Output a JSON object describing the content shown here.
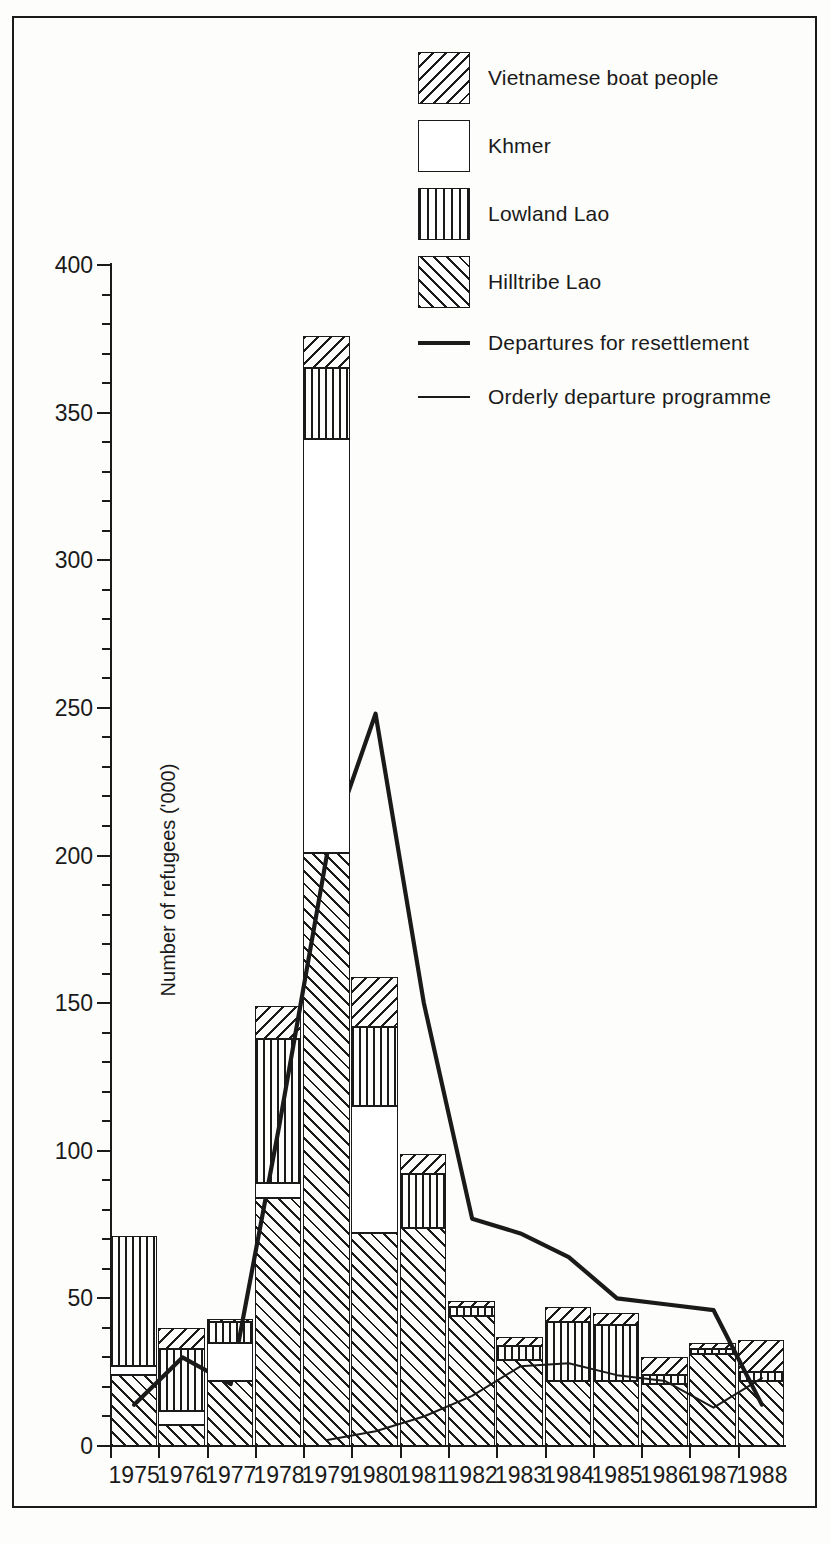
{
  "chart_data": {
    "type": "bar",
    "subtype": "stacked-bar-with-lines",
    "title": "",
    "xlabel": "",
    "ylabel": "Number of refugees ('000)",
    "ylim": [
      0,
      400
    ],
    "ytick_major": [
      0,
      50,
      100,
      150,
      200,
      250,
      300,
      350,
      400
    ],
    "ytick_labels": [
      "0",
      "50",
      "100",
      "150",
      "200",
      "250",
      "300",
      "350",
      "400"
    ],
    "ytick_minor_step": 10,
    "grid": false,
    "legend_position": "top-right",
    "categories": [
      "1975",
      "1976",
      "1977",
      "1978",
      "1979",
      "1980",
      "1981",
      "1982",
      "1983",
      "1984",
      "1985",
      "1986",
      "1987",
      "1988"
    ],
    "series": [
      {
        "name": "Hilltribe Lao",
        "pattern": "diagonal-45",
        "values": [
          24,
          7,
          22,
          84,
          201,
          72,
          74,
          44,
          29,
          22,
          22,
          21,
          31,
          22
        ]
      },
      {
        "name": "Khmer",
        "pattern": "solid-white",
        "values": [
          3,
          5,
          13,
          5,
          140,
          43,
          0,
          0,
          0,
          0,
          0,
          0,
          0,
          0
        ]
      },
      {
        "name": "Lowland Lao",
        "pattern": "vertical",
        "values": [
          44,
          21,
          7,
          49,
          24,
          27,
          18,
          3,
          5,
          20,
          19,
          3,
          2,
          3
        ]
      },
      {
        "name": "Vietnamese boat people",
        "pattern": "diagonal-135",
        "values": [
          0,
          7,
          1,
          11,
          11,
          17,
          7,
          2,
          3,
          5,
          4,
          6,
          2,
          11
        ]
      }
    ],
    "totals": [
      71,
      40,
      43,
      149,
      376,
      159,
      99,
      49,
      37,
      47,
      45,
      30,
      35,
      36
    ],
    "lines": [
      {
        "name": "Departures for resettlement",
        "style": "thick",
        "x": [
          "1975",
          "1976",
          "1977",
          "1978",
          "1979",
          "1980",
          "1981",
          "1982",
          "1983",
          "1984",
          "1985",
          "1986",
          "1987",
          "1988"
        ],
        "values": [
          14,
          30,
          21,
          108,
          201,
          248,
          150,
          77,
          72,
          64,
          50,
          48,
          46,
          14
        ]
      },
      {
        "name": "Orderly departure programme",
        "style": "thin",
        "x": [
          "1979",
          "1980",
          "1981",
          "1982",
          "1983",
          "1984",
          "1985",
          "1986",
          "1987",
          "1988"
        ],
        "values": [
          2,
          5,
          10,
          17,
          27,
          28,
          24,
          22,
          13,
          23
        ]
      }
    ]
  },
  "legend": {
    "items": [
      {
        "label": "Vietnamese boat people",
        "swatch": "vbp",
        "kind": "swatch"
      },
      {
        "label": "Khmer",
        "swatch": "khmer",
        "kind": "swatch"
      },
      {
        "label": "Lowland Lao",
        "swatch": "lowland",
        "kind": "swatch"
      },
      {
        "label": "Hilltribe Lao",
        "swatch": "hill",
        "kind": "swatch"
      },
      {
        "label": "Departures for resettlement",
        "swatch": "line-thick",
        "kind": "line"
      },
      {
        "label": "Orderly departure programme",
        "swatch": "line-thin",
        "kind": "line"
      }
    ]
  },
  "axis": {
    "y_title": "Number of refugees ('000)"
  },
  "colors": {
    "ink": "#1a1a1a",
    "paper": "#fdfdfb"
  }
}
